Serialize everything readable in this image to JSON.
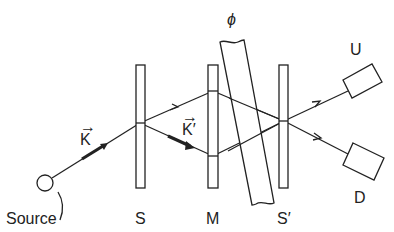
{
  "diagram": {
    "type": "Mach-Zehnder interferometer",
    "colors": {
      "ink": "#222222",
      "background": "#ffffff"
    },
    "labels": {
      "source": "Source",
      "splitter1": "S",
      "mirror": "M",
      "splitter2": "S′",
      "detector_up": "U",
      "detector_down": "D",
      "phase": "ϕ",
      "k_vector": "K",
      "k_prime_vector": "K′",
      "vector_arrow": "→"
    },
    "components": [
      {
        "id": "source",
        "shape": "circle",
        "label": "Source"
      },
      {
        "id": "S",
        "shape": "plate",
        "label": "S"
      },
      {
        "id": "M",
        "shape": "plate",
        "label": "M"
      },
      {
        "id": "phase-shifter",
        "shape": "tilted-slab",
        "label": "ϕ"
      },
      {
        "id": "S-prime",
        "shape": "plate",
        "label": "S′"
      },
      {
        "id": "U",
        "shape": "box",
        "label": "U"
      },
      {
        "id": "D",
        "shape": "box",
        "label": "D"
      }
    ]
  }
}
